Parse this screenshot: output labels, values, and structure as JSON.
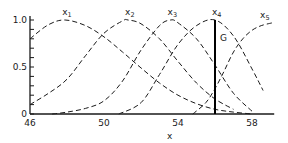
{
  "chart_data": {
    "type": "line",
    "title": "",
    "xlabel": "x",
    "ylabel": "",
    "xlim": [
      46,
      59.2
    ],
    "ylim": [
      0,
      1
    ],
    "xticks": [
      46,
      50,
      54,
      58
    ],
    "xtick_labels": [
      "46",
      "50",
      "54",
      "58"
    ],
    "yticks": [
      0,
      0.5,
      1.0
    ],
    "ytick_labels": [
      "0",
      "0.5",
      "1.0"
    ],
    "y_minor_step": 0.1,
    "grid": false,
    "legend": "none",
    "series": [
      {
        "name": "x1",
        "label_main": "x",
        "label_sub": "1",
        "style": "dashed",
        "x": [
          46,
          47,
          47.9,
          49,
          50,
          51,
          52,
          53,
          54,
          55,
          56,
          57,
          58
        ],
        "y": [
          0.8,
          0.95,
          1.0,
          0.94,
          0.82,
          0.66,
          0.49,
          0.33,
          0.2,
          0.11,
          0.05,
          0.02,
          0.0
        ]
      },
      {
        "name": "x2",
        "label_main": "x",
        "label_sub": "2",
        "style": "dashed",
        "x": [
          46,
          47,
          48,
          49,
          50,
          51,
          51.3,
          52,
          53,
          54,
          55,
          56,
          57
        ],
        "y": [
          0.1,
          0.22,
          0.37,
          0.62,
          0.86,
          0.99,
          1.0,
          0.96,
          0.8,
          0.56,
          0.33,
          0.16,
          0.05
        ]
      },
      {
        "name": "x3",
        "label_main": "x",
        "label_sub": "3",
        "style": "dashed",
        "x": [
          47.2,
          48,
          49,
          50,
          51,
          52,
          53,
          53.6,
          54,
          55,
          56,
          57,
          58
        ],
        "y": [
          0.0,
          0.02,
          0.06,
          0.14,
          0.35,
          0.68,
          0.94,
          1.0,
          0.97,
          0.8,
          0.52,
          0.22,
          0.03
        ]
      },
      {
        "name": "x4",
        "label_main": "x",
        "label_sub": "4",
        "style": "dashed",
        "x": [
          50.8,
          52,
          53,
          54,
          55,
          56,
          57,
          58,
          58.6
        ],
        "y": [
          0.0,
          0.12,
          0.42,
          0.74,
          0.94,
          1.0,
          0.83,
          0.48,
          0.25
        ]
      },
      {
        "name": "x5",
        "label_main": "x",
        "label_sub": "5",
        "style": "dashed",
        "x": [
          54.8,
          55.5,
          56,
          56.5,
          57,
          57.5,
          58,
          58.5,
          59.1
        ],
        "y": [
          0.0,
          0.12,
          0.27,
          0.46,
          0.66,
          0.8,
          0.89,
          0.94,
          0.97
        ]
      }
    ],
    "annotations": [
      {
        "type": "vertical-line",
        "x": 56.0,
        "y_from": 0,
        "y_to": 1.0,
        "label": "G"
      }
    ]
  }
}
